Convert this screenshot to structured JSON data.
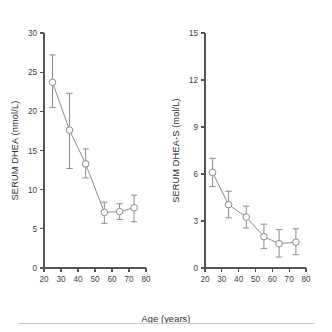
{
  "figure": {
    "background_color": "#ffffff",
    "marker_color": "#8c8c8c",
    "axis_color": "#555555",
    "text_color": "#3f3f3f",
    "shared_xlabel": "Age (years)",
    "footer_rule": true
  },
  "chart_data": [
    {
      "type": "scatter",
      "panel": "left",
      "title": "",
      "xlabel": "Age (years)",
      "ylabel": "SERUM DHEA (nmol/L)",
      "xlim": [
        20,
        80
      ],
      "ylim": [
        0,
        30
      ],
      "xticks": [
        20,
        30,
        40,
        50,
        60,
        70,
        80
      ],
      "xticklabels": [
        "20",
        "30",
        "40",
        "50",
        "60",
        "70",
        "80"
      ],
      "yticks": [
        0,
        5,
        10,
        15,
        20,
        25,
        30
      ],
      "yticklabels": [
        "0",
        "5",
        "10",
        "15",
        "20",
        "25",
        "30"
      ],
      "grid": false,
      "legend": "none",
      "line_connected": true,
      "error_bars": "symmetric-ish",
      "x": [
        25,
        35,
        44.5,
        55.5,
        64.5,
        73
      ],
      "values": [
        23.7,
        17.6,
        13.3,
        7.1,
        7.2,
        7.7
      ],
      "err_low": [
        20.5,
        12.7,
        11.5,
        5.7,
        6.2,
        5.9
      ],
      "err_high": [
        27.2,
        22.3,
        15.2,
        8.4,
        8.2,
        9.3
      ]
    },
    {
      "type": "scatter",
      "panel": "right",
      "title": "",
      "xlabel": "Age (years)",
      "ylabel": "SERUM DHEA-S (mol/L)",
      "xlim": [
        20,
        80
      ],
      "ylim": [
        0,
        15
      ],
      "xticks": [
        20,
        30,
        40,
        50,
        60,
        70,
        80
      ],
      "xticklabels": [
        "20",
        "30",
        "40",
        "50",
        "60",
        "70",
        "80"
      ],
      "yticks": [
        0,
        3,
        6,
        9,
        12,
        15
      ],
      "yticklabels": [
        "0",
        "3",
        "6",
        "9",
        "12",
        "15"
      ],
      "grid": false,
      "legend": "none",
      "line_connected": true,
      "error_bars": "symmetric-ish",
      "x": [
        24.5,
        34,
        44.5,
        55,
        64,
        74
      ],
      "values": [
        6.1,
        4.05,
        3.25,
        2.0,
        1.55,
        1.65
      ],
      "err_low": [
        5.2,
        3.2,
        2.55,
        1.25,
        0.7,
        0.85
      ],
      "err_high": [
        7.0,
        4.9,
        3.95,
        2.8,
        2.45,
        2.5
      ]
    }
  ]
}
